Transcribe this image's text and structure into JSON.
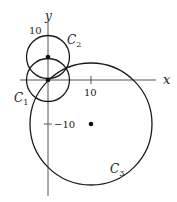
{
  "diagram": {
    "axes": {
      "x_label": "x",
      "y_label": "y",
      "x_tick_label": "10",
      "y_tick_label": "10",
      "y_neg_tick_label": "−10"
    },
    "circles": [
      {
        "label_base": "C",
        "label_sub": "1",
        "center": [
          0,
          0
        ],
        "center_dot": true
      },
      {
        "label_base": "C",
        "label_sub": "2",
        "center": [
          0,
          5
        ],
        "center_dot": true
      },
      {
        "label_base": "C",
        "label_sub": "3",
        "center": [
          10,
          -10
        ],
        "center_dot": true
      }
    ],
    "colors": {
      "stroke": "#1a1a1a",
      "axis": "#555555",
      "background": "#ffffff"
    }
  }
}
